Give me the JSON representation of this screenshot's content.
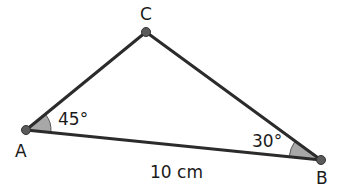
{
  "figure": {
    "type": "geometry-diagram",
    "shape": "triangle",
    "background_color": "#ffffff",
    "stroke_color": "#2b2b2b",
    "vertex_dot_color": "#5a5a5a",
    "angle_fill_color": "#a8a8a8",
    "angle_stroke_color": "#555555",
    "text_color": "#1a1a1a",
    "stroke_width": 3,
    "vertex_dot_radius": 4.5
  },
  "vertices": [
    {
      "id": "A",
      "label": "A",
      "x": 26,
      "y": 130,
      "label_x": 15,
      "label_y": 157
    },
    {
      "id": "B",
      "label": "B",
      "x": 321,
      "y": 160,
      "label_x": 316,
      "label_y": 184
    },
    {
      "id": "C",
      "label": "C",
      "x": 146,
      "y": 32,
      "label_x": 140,
      "label_y": 20
    }
  ],
  "sides": [
    {
      "id": "AB",
      "from": "A",
      "to": "B",
      "label": "10 cm",
      "label_x": 150,
      "label_y": 178
    },
    {
      "id": "AC",
      "from": "A",
      "to": "C",
      "label": ""
    },
    {
      "id": "CB",
      "from": "C",
      "to": "B",
      "label": ""
    }
  ],
  "angles": [
    {
      "id": "angle-A",
      "vertex": "A",
      "value": 45,
      "label": "45°",
      "label_x": 58,
      "label_y": 125,
      "wedge_radius": 25,
      "wedge_path": "M 26 130 L 50.9 132.5 A 25 25 0 0 0 46.3 114.0 Z"
    },
    {
      "id": "angle-B",
      "vertex": "B",
      "value": 30,
      "label": "30°",
      "label_x": 252,
      "label_y": 147,
      "wedge_radius": 32,
      "wedge_path": "M 321 160 L 289.2 156.8 A 32 32 0 0 0 293.6 140.2 Z"
    }
  ],
  "geometry_data": {
    "type": "triangle",
    "known_angles": {
      "A": 45,
      "B": 30
    },
    "derived_angle": {
      "C": 105
    },
    "known_sides": {
      "AB": "10 cm"
    },
    "unit": "cm",
    "side_length_value": 10
  }
}
